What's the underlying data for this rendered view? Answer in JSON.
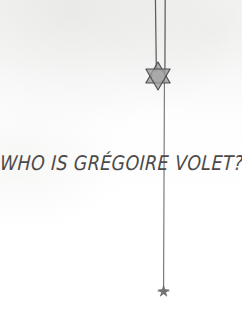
{
  "image": {
    "kind": "hand-drawn-sketch",
    "background_color": "#fdfdfc",
    "ink_color": "#59585a",
    "width": 242,
    "height": 313
  },
  "caption": {
    "text": "WHO IS GRÉGOIRE VOLET?",
    "color": "#4b4a48"
  },
  "ornaments": {
    "hexagram": {
      "name": "star-of-david",
      "fill_color": "#9a9a9a",
      "stroke_color": "#5a5a5a",
      "center_x": 158,
      "center_y": 76,
      "radius": 14
    },
    "small_star": {
      "name": "small-star",
      "fill_color": "#7c7c7c",
      "center_x": 164,
      "center_y": 291,
      "radius": 5
    }
  },
  "lines": {
    "left_cord": {
      "x": 155,
      "y_top": 0,
      "y_bottom": 72
    },
    "right_cord": {
      "x": 165,
      "y_top": 0,
      "y_bottom": 72
    },
    "main_cord": {
      "x": 164,
      "y_top": 80,
      "y_bottom": 289
    }
  }
}
